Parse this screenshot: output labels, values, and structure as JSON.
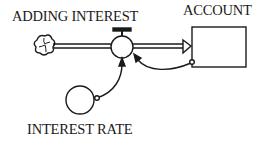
{
  "diagram": {
    "type": "stock-and-flow",
    "flow": {
      "label": "ADDING INTEREST"
    },
    "stock": {
      "label": "ACCOUNT"
    },
    "converter": {
      "label": "INTEREST RATE"
    },
    "source": {
      "icon": "cloud-icon"
    },
    "connectors": [
      {
        "from": "INTEREST RATE",
        "to": "ADDING INTEREST"
      },
      {
        "from": "ACCOUNT",
        "to": "ADDING INTEREST"
      }
    ],
    "colors": {
      "line": "#1a1a1a",
      "background": "#ffffff"
    }
  }
}
